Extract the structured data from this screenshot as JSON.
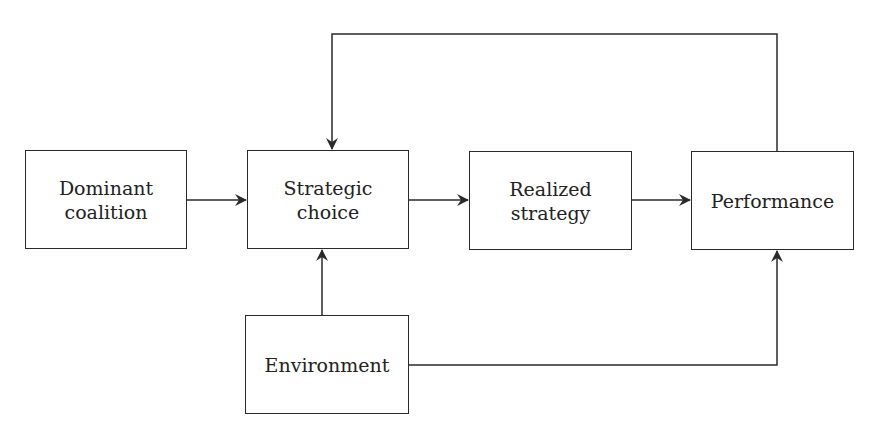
{
  "diagram": {
    "nodes": [
      {
        "id": "dominant",
        "label": "Dominant\ncoalition",
        "x": 25,
        "y": 150,
        "w": 162,
        "h": 99
      },
      {
        "id": "strategic",
        "label": "Strategic\nchoice",
        "x": 247,
        "y": 150,
        "w": 162,
        "h": 99
      },
      {
        "id": "realized",
        "label": "Realized\nstrategy",
        "x": 469,
        "y": 151,
        "w": 163,
        "h": 99
      },
      {
        "id": "performance",
        "label": "Performance",
        "x": 691,
        "y": 151,
        "w": 163,
        "h": 99
      },
      {
        "id": "environment",
        "label": "Environment",
        "x": 245,
        "y": 315,
        "w": 164,
        "h": 99
      }
    ],
    "edges": [
      {
        "from": "dominant",
        "to": "strategic"
      },
      {
        "from": "strategic",
        "to": "realized"
      },
      {
        "from": "realized",
        "to": "performance"
      },
      {
        "from": "performance",
        "to": "strategic",
        "type": "feedback"
      },
      {
        "from": "environment",
        "to": "strategic"
      },
      {
        "from": "environment",
        "to": "performance"
      }
    ],
    "colors": {
      "line": "#2a2a2a",
      "text": "#222222",
      "background": "#ffffff"
    }
  }
}
